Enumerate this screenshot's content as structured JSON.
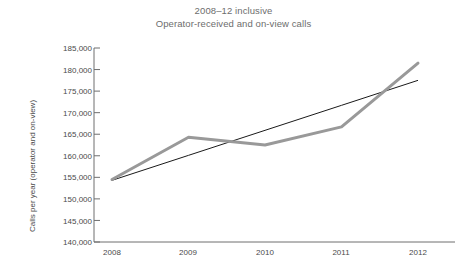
{
  "chart_data": {
    "type": "line",
    "title": "2008–12 inclusive",
    "subtitle": "Operator-received and on-view calls",
    "xlabel": "",
    "ylabel": "Calls per year (operator and on-view)",
    "categories": [
      "2008",
      "2009",
      "2010",
      "2011",
      "2012"
    ],
    "x": [
      2008,
      2009,
      2010,
      2011,
      2012
    ],
    "ylim": [
      140000,
      185000
    ],
    "ytick_labels": [
      "185,000",
      "180,000",
      "175,000",
      "170,000",
      "165,000",
      "160,000",
      "155,000",
      "150,000",
      "145,000",
      "140,000"
    ],
    "ytick_values": [
      185000,
      180000,
      175000,
      170000,
      165000,
      160000,
      155000,
      150000,
      145000,
      140000
    ],
    "ytick_step": 5000,
    "grid": false,
    "legend": "none",
    "series": [
      {
        "name": "Operator-received and on-view calls",
        "type": "line",
        "color": "#999999",
        "width": 3,
        "values": [
          154500,
          164300,
          162500,
          166700,
          181500
        ]
      },
      {
        "name": "Linear trend",
        "type": "trendline",
        "color": "#1a1a1a",
        "width": 1,
        "values": [
          154300,
          160100,
          165900,
          171700,
          177500
        ]
      }
    ]
  },
  "axis": {
    "y_color": "#6f6f6f",
    "x_color": "#6f6f6f"
  }
}
